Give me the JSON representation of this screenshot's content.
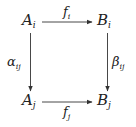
{
  "diagram": {
    "type": "commutative-square",
    "nodes": {
      "top_left": {
        "base": "A",
        "sub": "i"
      },
      "top_right": {
        "base": "B",
        "sub": "i"
      },
      "bottom_left": {
        "base": "A",
        "sub": "j"
      },
      "bottom_right": {
        "base": "B",
        "sub": "j"
      }
    },
    "edges": {
      "top": {
        "from": "A_i",
        "to": "B_i",
        "base": "f",
        "sub": "i"
      },
      "bottom": {
        "from": "A_j",
        "to": "B_j",
        "base": "f",
        "sub": "j"
      },
      "left": {
        "from": "A_i",
        "to": "A_j",
        "base": "α",
        "sub": "ij"
      },
      "right": {
        "from": "B_i",
        "to": "B_j",
        "base": "β",
        "sub": "ij"
      }
    },
    "colors": {
      "stroke": "#333333",
      "text": "#222222",
      "background": "#ffffff"
    }
  }
}
